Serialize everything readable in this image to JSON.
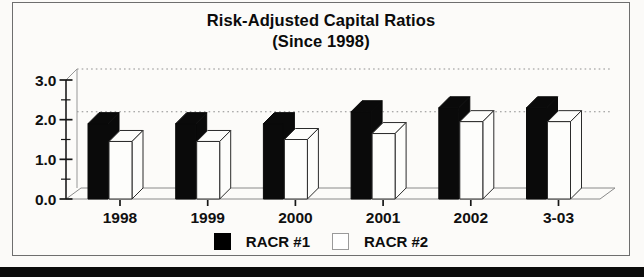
{
  "title": {
    "line1": "Risk-Adjusted Capital Ratios",
    "line2": "(Since 1998)"
  },
  "legend": {
    "items": [
      {
        "label": "RACR #1",
        "swatch_color": "#000000"
      },
      {
        "label": "RACR #2",
        "swatch_color": "#ffffff"
      }
    ]
  },
  "chart_data": {
    "type": "bar",
    "style": "3d-perspective-bars",
    "title": "Risk-Adjusted Capital Ratios (Since 1998)",
    "categories": [
      "1998",
      "1999",
      "2000",
      "2001",
      "2002",
      "3-03"
    ],
    "series": [
      {
        "name": "RACR #1",
        "color": "#000000",
        "values": [
          1.9,
          1.9,
          1.9,
          2.2,
          2.3,
          2.3
        ]
      },
      {
        "name": "RACR #2",
        "color": "#ffffff",
        "values": [
          1.45,
          1.45,
          1.5,
          1.65,
          1.95,
          1.95
        ]
      }
    ],
    "xlabel": "",
    "ylabel": "",
    "ylim": [
      0.0,
      3.0
    ],
    "y_ticks": [
      0.0,
      1.0,
      2.0,
      3.0
    ],
    "y_tick_labels": [
      "0.0",
      "1.0",
      "2.0",
      "3.0"
    ],
    "minor_tick_interval": 0.5,
    "reference_line": 2.2,
    "reference_line_style": "dotted",
    "grid": "off (single dotted reference line on back wall)",
    "legend_position": "bottom"
  },
  "colors": {
    "bar_fill_series1": "#0a0a0a",
    "bar_fill_series2": "#fdfdfb",
    "frame_border": "#6e6e6e",
    "dotted_line": "#8f8f8f",
    "text": "#101010",
    "page_divider": "#0b0b0b",
    "background": "#fbfaf8"
  }
}
